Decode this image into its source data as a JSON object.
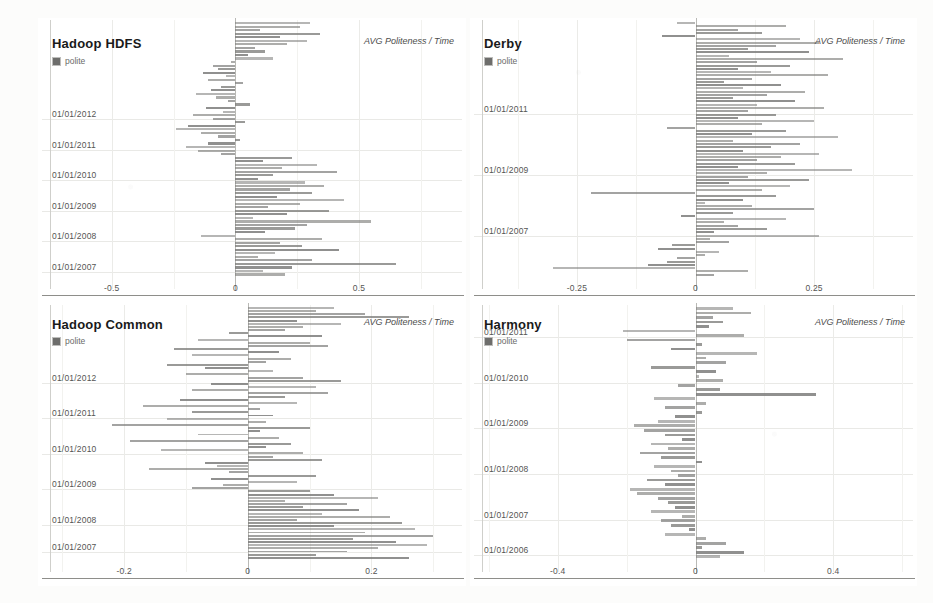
{
  "page": {
    "background": "#fbfbfa",
    "panel_background": "#ffffff",
    "bar_color": "#7a7a78",
    "grid_color": "#e9e9e6",
    "axis_color": "#8e8e8a"
  },
  "legend": {
    "swatch_label": "polite",
    "swatch_color": "#6d6d6b"
  },
  "measure_label": "AVG Politeness / Time",
  "chart_data": [
    {
      "type": "bar",
      "orientation": "horizontal",
      "title": "Hadoop HDFS",
      "xlabel": "",
      "ylabel": "",
      "legend": [
        "polite"
      ],
      "legend_position": "top-left",
      "grid": true,
      "measure": "AVG Politeness / Time",
      "xlim": [
        -0.75,
        0.9
      ],
      "xticks": [
        -0.5,
        0,
        0.5
      ],
      "xtick_labels": [
        "-0.5",
        "0",
        "0.5"
      ],
      "ytick_labels": [
        "01/01/2012",
        "01/01/2011",
        "01/01/2010",
        "01/01/2009",
        "01/01/2008",
        "01/01/2007"
      ],
      "ytick_positions": [
        0.62,
        0.5,
        0.38,
        0.26,
        0.14,
        0.02
      ],
      "values": [
        0.3,
        0.26,
        0.1,
        0.34,
        0.18,
        0.29,
        0.21,
        0.08,
        0.12,
        0.05,
        0.15,
        -0.02,
        -0.09,
        -0.07,
        -0.13,
        -0.04,
        -0.11,
        0.03,
        -0.06,
        -0.1,
        -0.16,
        -0.08,
        -0.03,
        0.06,
        -0.12,
        -0.05,
        -0.17,
        -0.09,
        0.04,
        -0.19,
        -0.24,
        -0.14,
        -0.07,
        0.02,
        -0.11,
        -0.2,
        -0.15,
        -0.06,
        0.23,
        0.11,
        0.33,
        0.19,
        0.41,
        0.15,
        0.09,
        0.28,
        0.36,
        0.22,
        0.31,
        0.17,
        0.44,
        0.26,
        0.13,
        0.38,
        0.21,
        0.07,
        0.55,
        0.29,
        0.24,
        0.12,
        -0.14,
        0.35,
        0.18,
        0.27,
        0.42,
        0.16,
        0.09,
        0.31,
        0.65,
        0.23,
        0.11,
        0.2
      ]
    },
    {
      "type": "bar",
      "orientation": "horizontal",
      "title": "Derby",
      "xlabel": "",
      "ylabel": "",
      "legend": [
        "polite"
      ],
      "legend_position": "top-left",
      "grid": true,
      "measure": "AVG Politeness / Time",
      "xlim": [
        -0.45,
        0.45
      ],
      "xticks": [
        -0.25,
        0,
        0.25
      ],
      "xtick_labels": [
        "-0.25",
        "0",
        "0.25"
      ],
      "ytick_labels": [
        "01/01/2011",
        "01/01/2009",
        "01/01/2007"
      ],
      "ytick_positions": [
        0.64,
        0.4,
        0.16
      ],
      "values": [
        -0.04,
        0.19,
        0.09,
        0.14,
        -0.07,
        0.22,
        0.26,
        0.17,
        0.11,
        0.24,
        0.07,
        0.31,
        0.13,
        0.2,
        0.09,
        0.16,
        0.28,
        0.12,
        0.06,
        0.18,
        0.1,
        0.23,
        0.15,
        0.08,
        0.21,
        0.13,
        0.27,
        0.11,
        0.17,
        0.09,
        0.25,
        0.14,
        -0.06,
        0.19,
        0.12,
        0.3,
        0.08,
        0.22,
        0.16,
        0.1,
        0.26,
        0.18,
        0.13,
        0.21,
        0.09,
        0.33,
        0.15,
        0.11,
        0.24,
        0.07,
        0.2,
        0.14,
        -0.22,
        0.17,
        0.1,
        0.02,
        0.12,
        0.25,
        0.08,
        -0.03,
        0.19,
        0.06,
        0.09,
        0.15,
        0.04,
        0.26,
        0.03,
        0.07,
        -0.05,
        -0.08,
        0.05,
        0.02,
        -0.04,
        -0.06,
        -0.1,
        -0.3,
        0.11,
        0.04
      ]
    },
    {
      "type": "bar",
      "orientation": "horizontal",
      "title": "Hadoop Common",
      "xlabel": "",
      "ylabel": "",
      "legend": [
        "polite"
      ],
      "legend_position": "top-left",
      "grid": true,
      "measure": "AVG Politeness / Time",
      "xlim": [
        -0.32,
        0.34
      ],
      "xticks": [
        -0.2,
        0,
        0.2
      ],
      "xtick_labels": [
        "-0.2",
        "0",
        "0.2"
      ],
      "ytick_labels": [
        "01/01/2012",
        "01/01/2011",
        "01/01/2010",
        "01/01/2009",
        "01/01/2008",
        "01/01/2007"
      ],
      "ytick_positions": [
        0.7,
        0.56,
        0.42,
        0.28,
        0.14,
        0.03
      ],
      "values": [
        0.14,
        0.11,
        0.19,
        0.26,
        0.08,
        0.15,
        0.09,
        0.06,
        -0.03,
        0.12,
        -0.08,
        0.1,
        0.13,
        -0.12,
        0.05,
        -0.09,
        0.07,
        0.03,
        -0.13,
        -0.07,
        0.04,
        -0.1,
        0.09,
        0.15,
        -0.06,
        0.11,
        -0.09,
        0.13,
        0.06,
        -0.11,
        0.08,
        -0.17,
        0.02,
        -0.09,
        0.04,
        -0.13,
        0.03,
        -0.22,
        0.1,
        0.02,
        -0.08,
        0.05,
        -0.19,
        0.07,
        0.03,
        -0.14,
        0.09,
        0.04,
        0.12,
        -0.07,
        -0.05,
        -0.16,
        -0.03,
        0.11,
        -0.06,
        0.08,
        -0.04,
        -0.09,
        0.1,
        0.14,
        0.21,
        0.06,
        0.16,
        0.09,
        0.18,
        0.12,
        0.23,
        0.08,
        0.25,
        0.14,
        0.27,
        0.19,
        0.3,
        0.17,
        0.24,
        0.29,
        0.21,
        0.16,
        0.11,
        0.26
      ]
    },
    {
      "type": "bar",
      "orientation": "horizontal",
      "title": "Harmony",
      "xlabel": "",
      "ylabel": "",
      "legend": [
        "polite"
      ],
      "legend_position": "top-left",
      "grid": true,
      "measure": "AVG Politeness / Time",
      "xlim": [
        -0.62,
        0.62
      ],
      "xticks": [
        -0.4,
        0,
        0.4
      ],
      "xtick_labels": [
        "-0.4",
        "0",
        "0.4"
      ],
      "ytick_labels": [
        "01/01/2011",
        "01/01/2010",
        "01/01/2009",
        "01/01/2008",
        "01/01/2007",
        "01/01/2006"
      ],
      "ytick_positions": [
        0.88,
        0.7,
        0.52,
        0.34,
        0.16,
        0.02
      ],
      "values": [
        0.11,
        0.16,
        0.05,
        0.08,
        0.04,
        -0.21,
        0.14,
        -0.2,
        0.02,
        -0.07,
        0.18,
        0.03,
        0.09,
        -0.13,
        0.06,
        0.01,
        0.08,
        -0.05,
        0.07,
        0.35,
        -0.12,
        0.03,
        -0.09,
        0.02,
        -0.06,
        -0.11,
        -0.18,
        -0.15,
        -0.09,
        -0.04,
        -0.13,
        -0.08,
        -0.16,
        -0.1,
        0.02,
        -0.12,
        -0.07,
        -0.05,
        -0.14,
        -0.09,
        -0.19,
        -0.17,
        -0.11,
        -0.08,
        -0.06,
        -0.13,
        -0.04,
        -0.1,
        -0.07,
        -0.02,
        -0.09,
        0.03,
        0.09,
        0.02,
        0.14,
        0.07
      ]
    }
  ]
}
